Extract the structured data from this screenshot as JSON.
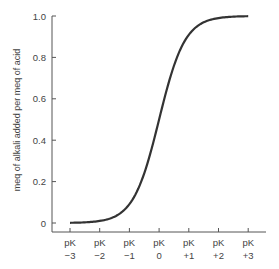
{
  "chart_data": {
    "type": "line",
    "title": "",
    "xlabel": "",
    "ylabel": "meq of alkali added per meq of acid",
    "x_ticks": [
      {
        "top": "pK",
        "bottom": "−3",
        "value": -3
      },
      {
        "top": "pK",
        "bottom": "−2",
        "value": -2
      },
      {
        "top": "pK",
        "bottom": "−1",
        "value": -1
      },
      {
        "top": "pK",
        "bottom": "0",
        "value": 0
      },
      {
        "top": "pK",
        "bottom": "+1",
        "value": 1
      },
      {
        "top": "pK",
        "bottom": "+2",
        "value": 2
      },
      {
        "top": "pK",
        "bottom": "+3",
        "value": 3
      }
    ],
    "y_ticks": [
      "0",
      "0.2",
      "0.4",
      "0.6",
      "0.8",
      "1.0"
    ],
    "ylim": [
      0,
      1.0
    ],
    "xlim": [
      -3,
      3
    ],
    "grid": false,
    "legend": null,
    "series": [
      {
        "name": "titration curve",
        "x": [
          -3,
          -2.5,
          -2,
          -1.5,
          -1,
          -0.5,
          0,
          0.5,
          1,
          1.5,
          2,
          2.5,
          3
        ],
        "values": [
          0.001,
          0.003,
          0.01,
          0.031,
          0.091,
          0.24,
          0.5,
          0.76,
          0.909,
          0.969,
          0.99,
          0.997,
          0.999
        ]
      }
    ],
    "colors": {
      "line": "#333333",
      "axis": "#555555"
    }
  }
}
